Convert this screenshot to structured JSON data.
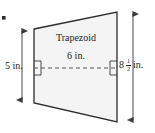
{
  "figure": {
    "type": "geometry-diagram",
    "subject": "trapezoid",
    "shape_label": "Trapezoid",
    "top_measure_label": "6 in.",
    "left_measure_label": "5 in.",
    "right_measure_whole": "8",
    "right_measure_numerator": "1",
    "right_measure_denominator": "2",
    "right_measure_unit": "in.",
    "bullet_mark": "",
    "colors": {
      "outline": "#2b2b2b",
      "fill": "#f4f4f4",
      "dimension_line": "#4a4a4a",
      "dashed_line": "#555555",
      "text": "#1b1b1b",
      "background": "#ffffff"
    },
    "geometry": {
      "top_left": [
        34,
        29
      ],
      "top_right": [
        117,
        12
      ],
      "bottom_right": [
        117,
        122
      ],
      "bottom_left": [
        34,
        103
      ],
      "dashed_height_y": 68,
      "left_dimension_x": 22,
      "left_dimension_top": 30,
      "left_dimension_bottom": 101,
      "right_dimension_x": 133,
      "right_dimension_top": 13,
      "right_dimension_bottom": 121
    }
  }
}
